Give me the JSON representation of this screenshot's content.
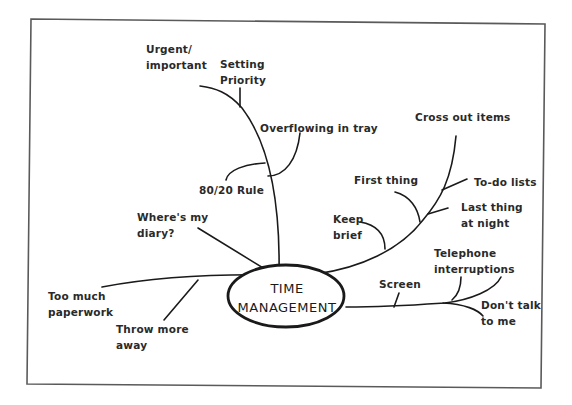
{
  "center": {
    "line1": "TIME",
    "line2": "MANAGEMENT"
  },
  "branches": {
    "top": {
      "labels": {
        "urgent": "Urgent/\nimportant",
        "setting_priority": "Setting\nPriority",
        "overflowing": "Overflowing in tray",
        "rule_80_20": "80/20 Rule"
      }
    },
    "left_upper": {
      "labels": {
        "diary": "Where's my\ndiary?"
      }
    },
    "left": {
      "labels": {
        "paperwork": "Too much\npaperwork",
        "throw_away": "Throw more\naway"
      }
    },
    "right_upper": {
      "labels": {
        "cross_out": "Cross out items",
        "todo": "To-do lists",
        "first_thing": "First thing",
        "last_thing": "Last thing\nat night",
        "keep_brief": "Keep\nbrief"
      }
    },
    "right": {
      "labels": {
        "screen": "Screen",
        "telephone": "Telephone\ninterruptions",
        "dont_talk": "Don't talk\nto me"
      }
    }
  },
  "colors": {
    "ink": "#1a1a1a",
    "frame": "#555555",
    "background": "#ffffff"
  }
}
